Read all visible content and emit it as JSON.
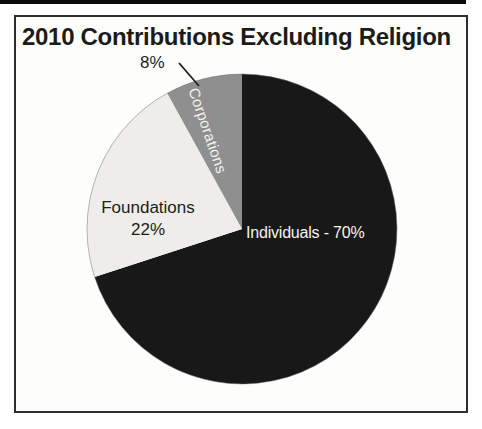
{
  "frame": {
    "border_color": "#2e2e2c",
    "background": "#fdfdfc"
  },
  "artifacts": {
    "top_edge_strip_color": "#0b0b0b"
  },
  "chart_data": {
    "type": "pie",
    "title": "2010 Contributions Excluding Religion",
    "direction": "clockwise",
    "start_angle_deg": 0,
    "legend_position": "none",
    "total": 100,
    "slices": [
      {
        "label": "Individuals",
        "value": 70,
        "inside_label": "Individuals - 70%",
        "color": "#181818",
        "text_color": "#f4f3f1"
      },
      {
        "label": "Foundations",
        "value": 22,
        "inside_label_line1": "Foundations",
        "inside_label_line2": "22%",
        "color": "#eeede9",
        "text_color": "#1d1d1b"
      },
      {
        "label": "Corporations",
        "value": 8,
        "inside_label": "Corporations",
        "callout_label": "8%",
        "color": "#8f8f8f",
        "text_color": "#f4f3f1"
      }
    ]
  }
}
